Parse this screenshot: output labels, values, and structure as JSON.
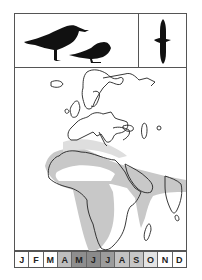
{
  "card": {
    "panels": {
      "perched_birds": {
        "icons": [
          "bird-standing-silhouette-icon",
          "bird-crouching-silhouette-icon"
        ]
      },
      "flight": {
        "icon": "bird-in-flight-silhouette-icon"
      },
      "map": {
        "region": "Europe, Africa, Middle East, South Asia",
        "range_color": "#c8c8c8",
        "coast_color": "#222222"
      }
    },
    "months": [
      {
        "label": "J",
        "shade": "#ffffff"
      },
      {
        "label": "F",
        "shade": "#ffffff"
      },
      {
        "label": "M",
        "shade": "#ffffff"
      },
      {
        "label": "A",
        "shade": "#bdbdbd"
      },
      {
        "label": "M",
        "shade": "#8e8e8e"
      },
      {
        "label": "J",
        "shade": "#8a8a8a"
      },
      {
        "label": "J",
        "shade": "#9c9c9c"
      },
      {
        "label": "A",
        "shade": "#c2c2c2"
      },
      {
        "label": "S",
        "shade": "#c6c6c6"
      },
      {
        "label": "O",
        "shade": "#e4e4e4"
      },
      {
        "label": "N",
        "shade": "#ffffff"
      },
      {
        "label": "D",
        "shade": "#ffffff"
      }
    ]
  }
}
